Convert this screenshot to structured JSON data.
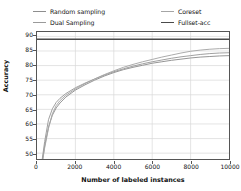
{
  "chart_data": {
    "type": "line",
    "title": "",
    "xlabel": "Number of labeled instances",
    "ylabel": "Accuracy",
    "xlim": [
      0,
      10000
    ],
    "ylim": [
      48,
      91.5
    ],
    "xticks": [
      0,
      2000,
      4000,
      6000,
      8000,
      10000
    ],
    "yticks": [
      50,
      55,
      60,
      65,
      70,
      75,
      80,
      85,
      90
    ],
    "xtick_labels": [
      "0",
      "2000",
      "4000",
      "6000",
      "8000",
      "10000"
    ],
    "ytick_labels": [
      "50",
      "55",
      "60",
      "65",
      "70",
      "75",
      "80",
      "85",
      "90"
    ],
    "grid": true,
    "legend_position": "top",
    "series": [
      {
        "name": "Random sampling",
        "color": "#8e8e8e",
        "x": [
          200,
          400,
          600,
          800,
          1000,
          1200,
          1500,
          2000,
          2500,
          3000,
          3500,
          4000,
          4500,
          5000,
          5500,
          6000,
          6500,
          7000,
          7500,
          8000,
          8500,
          9000,
          9500,
          10000
        ],
        "y": [
          44.0,
          52.5,
          59.0,
          63.0,
          65.5,
          67.2,
          69.2,
          71.6,
          73.4,
          75.0,
          76.4,
          77.6,
          78.6,
          79.4,
          80.1,
          80.8,
          81.3,
          81.8,
          82.2,
          82.6,
          82.9,
          83.1,
          83.3,
          83.4
        ]
      },
      {
        "name": "Dual Sampling",
        "color": "#9a9a9a",
        "x": [
          200,
          400,
          600,
          800,
          1000,
          1200,
          1500,
          2000,
          2500,
          3000,
          3500,
          4000,
          4500,
          5000,
          5500,
          6000,
          6500,
          7000,
          7500,
          8000,
          8500,
          9000,
          9500,
          10000
        ],
        "y": [
          44.5,
          54.0,
          61.5,
          65.2,
          67.4,
          68.8,
          70.4,
          72.4,
          74.0,
          75.4,
          76.7,
          77.9,
          78.9,
          79.8,
          80.6,
          81.3,
          81.9,
          82.5,
          83.0,
          83.4,
          83.8,
          84.1,
          84.3,
          84.4
        ]
      },
      {
        "name": "Coreset",
        "color": "#a5a5a5",
        "x": [
          200,
          400,
          600,
          800,
          1000,
          1200,
          1500,
          2000,
          2500,
          3000,
          3500,
          4000,
          4500,
          5000,
          5500,
          6000,
          6500,
          7000,
          7500,
          8000,
          8500,
          9000,
          9500,
          10000
        ],
        "y": [
          43.5,
          51.8,
          58.5,
          63.5,
          66.3,
          68.0,
          69.8,
          72.0,
          73.8,
          75.4,
          76.9,
          78.2,
          79.4,
          80.4,
          81.3,
          82.1,
          82.9,
          83.6,
          84.3,
          84.9,
          85.3,
          85.6,
          85.8,
          85.9
        ]
      },
      {
        "name": "Fullset-acc",
        "color": "#4a4a4a",
        "x": [
          0,
          10000
        ],
        "y": [
          89.0,
          89.0
        ]
      }
    ]
  },
  "legend": {
    "left_column": [
      {
        "label": "Random sampling",
        "color": "#8e8e8e"
      },
      {
        "label": "Dual Sampling",
        "color": "#9a9a9a"
      }
    ],
    "right_column": [
      {
        "label": "Coreset",
        "color": "#a5a5a5"
      },
      {
        "label": "Fullset-acc",
        "color": "#4a4a4a"
      }
    ]
  }
}
